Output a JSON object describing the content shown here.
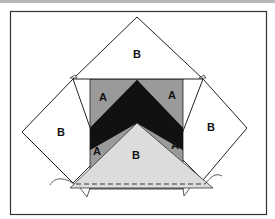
{
  "diagram": {
    "type": "quilt-block-assembly",
    "labels": {
      "top_triangle": "B",
      "left_triangle": "B",
      "right_triangle": "B",
      "bottom_triangle": "B",
      "upper_left_piece": "A",
      "upper_right_piece": "A",
      "lower_left_piece": "A",
      "lower_right_piece": "A"
    },
    "colors": {
      "background": "#ffffff",
      "frame": "#333333",
      "gray_fabric": "#9a9a9a",
      "dark_fabric": "#111111",
      "light_fabric": "#dcdcdc",
      "top_bar": "#b8b8b8"
    },
    "seam_style": "dashed"
  }
}
